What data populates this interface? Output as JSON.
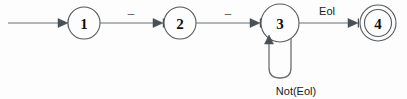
{
  "diagram": {
    "type": "state-transition-diagram",
    "background_color": "#fdfdfd",
    "stroke_color": "#555a5e",
    "edge_color": "#6b7074",
    "text_color": "#111111",
    "states": [
      {
        "id": "s1",
        "label": "1",
        "cx": 84,
        "cy": 23,
        "r": 16,
        "accepting": false
      },
      {
        "id": "s2",
        "label": "2",
        "cx": 180,
        "cy": 23,
        "r": 16,
        "accepting": false
      },
      {
        "id": "s3",
        "label": "3",
        "cx": 280,
        "cy": 23,
        "r": 19,
        "accepting": false
      },
      {
        "id": "s4",
        "label": "4",
        "cx": 378,
        "cy": 23,
        "r": 18,
        "accepting": true
      }
    ],
    "transitions": [
      {
        "id": "t-start",
        "from": "start",
        "to": "s1",
        "label": ""
      },
      {
        "id": "t12",
        "from": "s1",
        "to": "s2",
        "label": "–"
      },
      {
        "id": "t23",
        "from": "s2",
        "to": "s3",
        "label": "–"
      },
      {
        "id": "t33",
        "from": "s3",
        "to": "s3",
        "label": "Not(Eol)",
        "self_loop": true
      },
      {
        "id": "t34",
        "from": "s3",
        "to": "s4",
        "label": "Eol"
      }
    ],
    "labels": {
      "edge_1_2": "–",
      "edge_2_3": "–",
      "edge_3_4": "Eol",
      "self_loop_3": "Not(Eol)"
    }
  }
}
